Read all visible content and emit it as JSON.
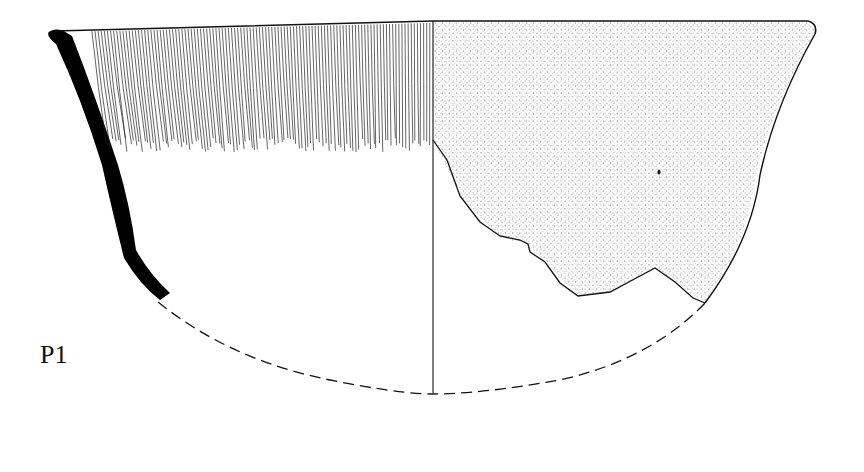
{
  "figure": {
    "label": "P1",
    "colors": {
      "ink": "#111111",
      "background": "#ffffff",
      "section": "#000000"
    }
  }
}
